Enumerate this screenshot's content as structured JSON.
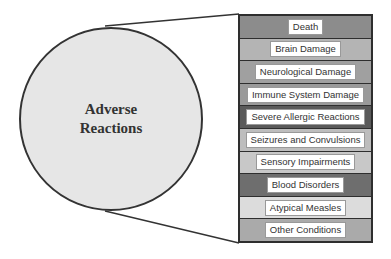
{
  "diagram": {
    "center": {
      "label": "Adverse\nReactions",
      "fill": "#e6e6e6"
    },
    "items": [
      {
        "label": "Death",
        "fill": "#8c8c8c"
      },
      {
        "label": "Brain Damage",
        "fill": "#b4b4b4"
      },
      {
        "label": "Neurological Damage",
        "fill": "#a0a0a0"
      },
      {
        "label": "Immune System Damage",
        "fill": "#9a9a9a"
      },
      {
        "label": "Severe Allergic Reactions",
        "fill": "#5a5a5a"
      },
      {
        "label": "Seizures and Convulsions",
        "fill": "#bdbdbd"
      },
      {
        "label": "Sensory Impairments",
        "fill": "#c8c8c8"
      },
      {
        "label": "Blood Disorders",
        "fill": "#6e6e6e"
      },
      {
        "label": "Atypical Measles",
        "fill": "#dcdcdc"
      },
      {
        "label": "Other Conditions",
        "fill": "#aaaaaa"
      }
    ]
  }
}
